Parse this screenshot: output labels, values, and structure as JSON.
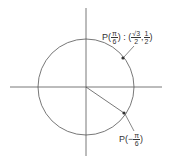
{
  "diagram": {
    "type": "unit-circle",
    "center": [
      86,
      87
    ],
    "radius": 48,
    "stroke_color": "#555555",
    "point_color": "#333333",
    "points": [
      {
        "name": "P(π/6)",
        "angle_deg": 30,
        "coords": "(√3/2, 1/2)"
      },
      {
        "name": "P(−π/6)",
        "angle_deg": -30
      }
    ],
    "label_top": {
      "prefix": "P(",
      "num": "π",
      "den": "6",
      "mid": ") : (",
      "x_num": "√3",
      "x_den": "2",
      "sep": ",",
      "y_num": "1",
      "y_den": "2",
      "suffix": ")"
    },
    "label_bottom": {
      "prefix": "P(−",
      "num": "π",
      "den": "6",
      "suffix": ")"
    }
  }
}
